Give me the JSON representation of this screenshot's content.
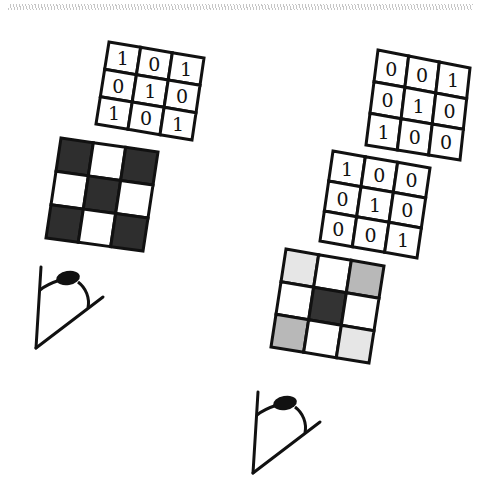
{
  "diagram": {
    "left_panel": {
      "number_grid": {
        "values": [
          [
            "1",
            "0",
            "1"
          ],
          [
            "0",
            "1",
            "0"
          ],
          [
            "1",
            "0",
            "1"
          ]
        ],
        "corners": [
          [
            109,
            42
          ],
          [
            204,
            58
          ],
          [
            192,
            140
          ],
          [
            96,
            124
          ]
        ]
      },
      "shaded_grid": {
        "fills": [
          [
            "#2e2e2e",
            "#ffffff",
            "#2e2e2e"
          ],
          [
            "#ffffff",
            "#2e2e2e",
            "#ffffff"
          ],
          [
            "#2e2e2e",
            "#ffffff",
            "#2e2e2e"
          ]
        ],
        "corners": [
          [
            61,
            138
          ],
          [
            158,
            152
          ],
          [
            143,
            251
          ],
          [
            46,
            238
          ]
        ]
      },
      "eye": {
        "label": "eye-viewer",
        "origin": [
          36,
          348
        ]
      }
    },
    "right_panel": {
      "top_number_grid": {
        "values": [
          [
            "0",
            "0",
            "1"
          ],
          [
            "0",
            "1",
            "0"
          ],
          [
            "1",
            "0",
            "0"
          ]
        ],
        "corners": [
          [
            378,
            50
          ],
          [
            470,
            68
          ],
          [
            460,
            160
          ],
          [
            366,
            145
          ]
        ]
      },
      "middle_number_grid": {
        "values": [
          [
            "1",
            "0",
            "0"
          ],
          [
            "0",
            "1",
            "0"
          ],
          [
            "0",
            "0",
            "1"
          ]
        ],
        "corners": [
          [
            333,
            151
          ],
          [
            430,
            168
          ],
          [
            417,
            258
          ],
          [
            320,
            241
          ]
        ]
      },
      "shaded_grid": {
        "fills": [
          [
            "#e6e6e6",
            "#ffffff",
            "#b8b8b8"
          ],
          [
            "#ffffff",
            "#333333",
            "#ffffff"
          ],
          [
            "#b8b8b8",
            "#ffffff",
            "#e6e6e6"
          ]
        ],
        "corners": [
          [
            286,
            249
          ],
          [
            384,
            266
          ],
          [
            369,
            363
          ],
          [
            271,
            347
          ]
        ]
      },
      "eye": {
        "label": "eye-viewer",
        "origin": [
          253,
          473
        ]
      }
    },
    "colors": {
      "stroke": "#111111",
      "background": "#ffffff"
    }
  }
}
